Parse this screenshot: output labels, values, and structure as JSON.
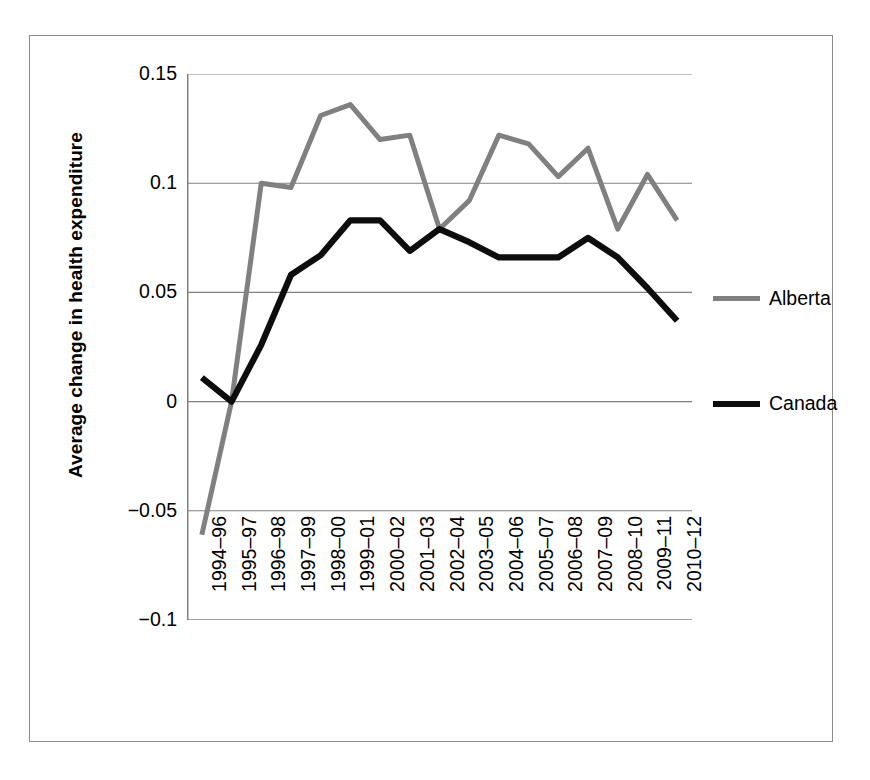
{
  "chart_data": {
    "type": "line",
    "title": "",
    "xlabel": "",
    "ylabel": "Average change in health expenditure",
    "categories": [
      "1994–96",
      "1995–97",
      "1996–98",
      "1997–99",
      "1998–00",
      "1999–01",
      "2000–02",
      "2001–03",
      "2002–04",
      "2003–05",
      "2004–06",
      "2005–07",
      "2006–08",
      "2007–09",
      "2008–10",
      "2009–11",
      "2010–12"
    ],
    "series": [
      {
        "name": "Alberta",
        "color": "#808080",
        "values": [
          -0.061,
          0.0,
          0.1,
          0.098,
          0.131,
          0.136,
          0.12,
          0.122,
          0.079,
          0.092,
          0.122,
          0.118,
          0.103,
          0.116,
          0.079,
          0.104,
          0.083
        ]
      },
      {
        "name": "Canada",
        "color": "#0d0d0d",
        "values": [
          0.011,
          0.0,
          0.026,
          0.058,
          0.067,
          0.083,
          0.083,
          0.069,
          0.079,
          0.073,
          0.066,
          0.066,
          0.066,
          0.075,
          0.066,
          0.052,
          0.037
        ]
      }
    ],
    "ylim": [
      -0.1,
      0.15
    ],
    "yticks": [
      0.15,
      0.1,
      0.05,
      0,
      -0.05,
      -0.1
    ],
    "ytick_labels": [
      "0.15",
      "0.1",
      "0.05",
      "0",
      "−0.05",
      "−0.1"
    ],
    "grid": {
      "horizontal": true,
      "vertical": false,
      "color": "#808080"
    },
    "legend": {
      "position": "right",
      "entries": [
        {
          "label": "Alberta",
          "color": "#808080"
        },
        {
          "label": "Canada",
          "color": "#0d0d0d"
        }
      ]
    },
    "axis": {
      "line_color": "#808080",
      "tick_marks": true,
      "x_label_rotation": -90
    }
  }
}
